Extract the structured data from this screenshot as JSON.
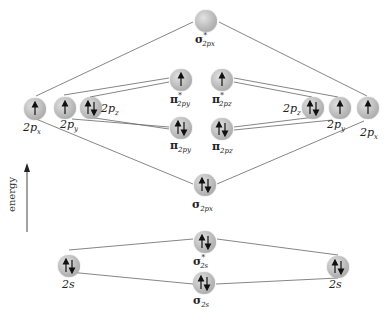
{
  "diagram": {
    "axis": {
      "label": "energy",
      "direction": "up"
    },
    "left_atom": {
      "2p": [
        {
          "id": "2px",
          "label_main": "2p",
          "label_sub": "x",
          "electrons": "up"
        },
        {
          "id": "2py",
          "label_main": "2p",
          "label_sub": "y",
          "electrons": "up"
        },
        {
          "id": "2pz",
          "label_main": "2p",
          "label_sub": "z",
          "electrons": "pair"
        }
      ],
      "2s": {
        "label_main": "2s",
        "electrons": "pair"
      }
    },
    "right_atom": {
      "2p": [
        {
          "id": "2pz",
          "label_main": "2p",
          "label_sub": "z",
          "electrons": "pair"
        },
        {
          "id": "2py",
          "label_main": "2p",
          "label_sub": "y",
          "electrons": "up"
        },
        {
          "id": "2px",
          "label_main": "2p",
          "label_sub": "x",
          "electrons": "up"
        }
      ],
      "2s": {
        "label_main": "2s",
        "electrons": "pair"
      }
    },
    "molecular_orbitals": {
      "sigma_star_2px": {
        "symbol": "σ",
        "star": "*",
        "sub": "2px",
        "electrons": "empty"
      },
      "pi_star_2py": {
        "symbol": "π",
        "star": "*",
        "sub": "2py",
        "electrons": "up"
      },
      "pi_star_2pz": {
        "symbol": "π",
        "star": "*",
        "sub": "2pz",
        "electrons": "up"
      },
      "pi_2py": {
        "symbol": "π",
        "star": "",
        "sub": "2py",
        "electrons": "pair"
      },
      "pi_2pz": {
        "symbol": "π",
        "star": "",
        "sub": "2pz",
        "electrons": "pair"
      },
      "sigma_2px": {
        "symbol": "σ",
        "star": "",
        "sub": "2px",
        "electrons": "pair"
      },
      "sigma_star_2s": {
        "symbol": "σ",
        "star": "*",
        "sub": "2s",
        "electrons": "pair"
      },
      "sigma_2s": {
        "symbol": "σ",
        "star": "",
        "sub": "2s",
        "electrons": "pair"
      }
    },
    "colors": {
      "orbital_fill": "#b9b9b9",
      "line": "#555555",
      "text": "#222222"
    }
  }
}
